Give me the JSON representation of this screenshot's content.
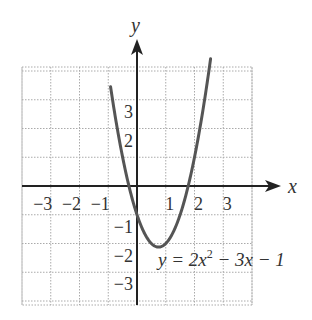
{
  "chart_data": {
    "type": "line",
    "title": "",
    "equation": {
      "prefix": "y = 2x",
      "exponent": "2",
      "suffix": " − 3x − 1"
    },
    "function": {
      "a": 2,
      "b": -3,
      "c": -1
    },
    "xlabel": "x",
    "ylabel": "y",
    "xlim": [
      -4,
      4
    ],
    "ylim": [
      -4.1,
      4.1
    ],
    "grid": true,
    "x_ticks": [
      {
        "value": -3,
        "label": "−3"
      },
      {
        "value": -2,
        "label": "−2"
      },
      {
        "value": -1,
        "label": "−1"
      },
      {
        "value": 1,
        "label": "1"
      },
      {
        "value": 2,
        "label": "2"
      },
      {
        "value": 3,
        "label": "3"
      }
    ],
    "y_ticks": [
      {
        "value": 3,
        "label": "3"
      },
      {
        "value": 2,
        "label": "2"
      },
      {
        "value": -1,
        "label": "−1"
      },
      {
        "value": -2,
        "label": "−2"
      },
      {
        "value": -3,
        "label": "−3"
      }
    ],
    "series": [
      {
        "name": "y = 2x^2 - 3x - 1",
        "x": [
          -0.9,
          -0.5,
          0,
          0.5,
          0.75,
          1,
          1.5,
          2,
          2.5
        ],
        "y": [
          3.32,
          1,
          -1,
          -2,
          -2.125,
          -2,
          -1,
          1,
          4
        ]
      }
    ],
    "annotations": [
      {
        "text": "y = 2x² − 3x − 1",
        "position": "bottom-right, near vertex"
      }
    ],
    "colors": {
      "curve": "#555555",
      "axis": "#222222",
      "grid": "#aaaaaa"
    }
  }
}
